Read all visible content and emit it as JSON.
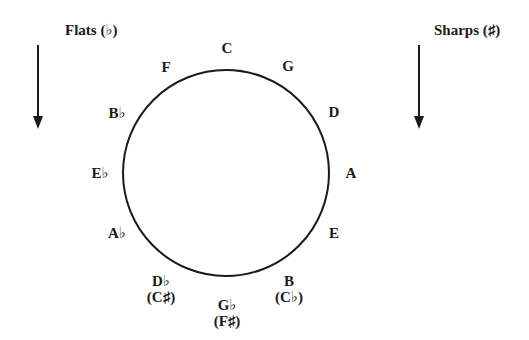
{
  "headings": {
    "flats": "Flats (♭)",
    "sharps": "Sharps (♯)"
  },
  "arrows": {
    "flats": "arrow-down",
    "sharps": "arrow-down"
  },
  "circle": {
    "center_x": 226,
    "center_y": 173,
    "radius": 103,
    "stroke": "#1a1a1a"
  },
  "keys": [
    {
      "name": "C",
      "alt": ""
    },
    {
      "name": "G",
      "alt": ""
    },
    {
      "name": "D",
      "alt": ""
    },
    {
      "name": "A",
      "alt": ""
    },
    {
      "name": "E",
      "alt": ""
    },
    {
      "name": "B",
      "alt": "(C♭)"
    },
    {
      "name": "G♭",
      "alt": "(F♯)"
    },
    {
      "name": "D♭",
      "alt": "(C♯)"
    },
    {
      "name": "A♭",
      "alt": ""
    },
    {
      "name": "E♭",
      "alt": ""
    },
    {
      "name": "B♭",
      "alt": ""
    },
    {
      "name": "F",
      "alt": ""
    }
  ]
}
